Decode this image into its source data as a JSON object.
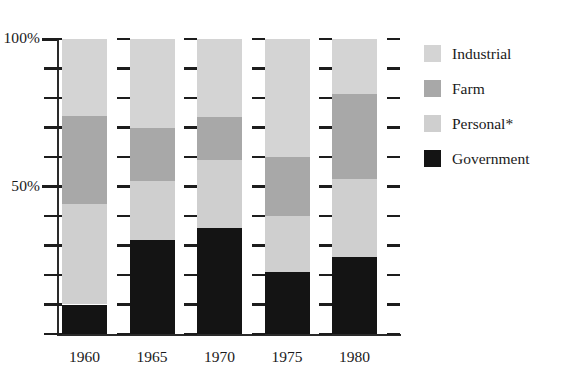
{
  "chart_data": {
    "type": "bar",
    "subtype": "stacked-percentage",
    "title": "",
    "xlabel": "",
    "ylabel": "",
    "categories": [
      "1960",
      "1965",
      "1970",
      "1975",
      "1980"
    ],
    "ylim": [
      0,
      100
    ],
    "ytick_values": [
      0,
      10,
      20,
      30,
      40,
      50,
      60,
      70,
      80,
      90,
      100
    ],
    "ytick_labels": [
      "",
      "",
      "",
      "",
      "",
      "50%",
      "",
      "",
      "",
      "",
      "100%"
    ],
    "labeled_yticks": [
      {
        "value": 100,
        "label": "100%"
      },
      {
        "value": 50,
        "label": "50%"
      }
    ],
    "grid": false,
    "legend_position": "right",
    "stack_order_bottom_to_top": [
      "Government",
      "Personal*",
      "Farm",
      "Industrial"
    ],
    "series": [
      {
        "name": "Industrial",
        "color": "#d4d4d4",
        "values": [
          26,
          30,
          26.5,
          40,
          18.5
        ]
      },
      {
        "name": "Farm",
        "color": "#a8a8a8",
        "values": [
          30,
          18,
          14.5,
          20,
          29
        ]
      },
      {
        "name": "Personal*",
        "color": "#cfcfcf",
        "values": [
          34,
          20,
          23,
          19,
          26.5
        ]
      },
      {
        "name": "Government",
        "color": "#141414",
        "values": [
          10,
          32,
          36,
          21,
          26
        ]
      }
    ],
    "cumulative_tops_percent": {
      "1960": {
        "Government": 10,
        "Personal*": 44,
        "Farm": 74,
        "Industrial": 100
      },
      "1965": {
        "Government": 32,
        "Personal*": 52,
        "Farm": 70,
        "Industrial": 100
      },
      "1970": {
        "Government": 36,
        "Personal*": 59,
        "Farm": 73.5,
        "Industrial": 100
      },
      "1975": {
        "Government": 21,
        "Personal*": 40,
        "Farm": 60,
        "Industrial": 100
      },
      "1980": {
        "Government": 26,
        "Personal*": 52.5,
        "Farm": 81.5,
        "Industrial": 100
      }
    }
  },
  "legend": {
    "items": [
      {
        "label": "Industrial",
        "color": "#d4d4d4"
      },
      {
        "label": "Farm",
        "color": "#a8a8a8"
      },
      {
        "label": "Personal*",
        "color": "#cfcfcf"
      },
      {
        "label": "Government",
        "color": "#141414"
      }
    ]
  },
  "axis": {
    "y_top_label": "100%",
    "y_mid_label": "50%"
  },
  "colors": {
    "axis": "#2a2a2a",
    "text": "#1a1a1a",
    "background": "#ffffff"
  }
}
